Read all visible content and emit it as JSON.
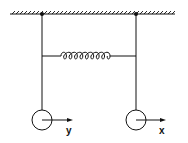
{
  "diagram": {
    "labels": {
      "left_displacement": "y",
      "right_displacement": "x"
    },
    "colors": {
      "stroke": "#111111",
      "background": "#ffffff"
    }
  }
}
